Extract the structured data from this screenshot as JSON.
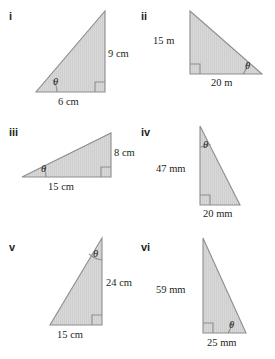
{
  "page": {
    "background": "#ffffff",
    "ink": "#231f20",
    "fill": "#d4d4d4",
    "stroke": "#8e8e8e",
    "title": ""
  },
  "figures": [
    {
      "numeral": "i",
      "theta": "θ",
      "labels": [
        "9 cm",
        "6 cm"
      ],
      "right_angle_corner": "bottom-right",
      "theta_corner": "bottom-left",
      "vertical_label": "9 cm",
      "base_label": "6 cm",
      "unit": "cm",
      "vertical_value": 9,
      "base_value": 6
    },
    {
      "numeral": "ii",
      "theta": "θ",
      "labels": [
        "15 m",
        "20 m"
      ],
      "right_angle_corner": "bottom-left",
      "theta_corner": "bottom-right",
      "vertical_label": "15 m",
      "base_label": "20 m",
      "unit": "m",
      "vertical_value": 15,
      "base_value": 20
    },
    {
      "numeral": "iii",
      "theta": "θ",
      "labels": [
        "8 cm",
        "15 cm"
      ],
      "right_angle_corner": "bottom-right",
      "theta_corner": "bottom-left",
      "vertical_label": "8 cm",
      "base_label": "15 cm",
      "unit": "cm",
      "vertical_value": 8,
      "base_value": 15
    },
    {
      "numeral": "iv",
      "theta": "θ",
      "labels": [
        "47 mm",
        "20 mm"
      ],
      "right_angle_corner": "bottom-left",
      "theta_corner": "top",
      "vertical_label": "47 mm",
      "base_label": "20 mm",
      "unit": "mm",
      "vertical_value": 47,
      "base_value": 20
    },
    {
      "numeral": "v",
      "theta": "θ",
      "labels": [
        "24 cm",
        "15 cm"
      ],
      "right_angle_corner": "bottom-right",
      "theta_corner": "top",
      "vertical_label": "24 cm",
      "base_label": "15 cm",
      "unit": "cm",
      "vertical_value": 24,
      "base_value": 15
    },
    {
      "numeral": "vi",
      "theta": "θ",
      "labels": [
        "59 mm",
        "25 mm"
      ],
      "right_angle_corner": "bottom-left",
      "theta_corner": "bottom-right",
      "vertical_label": "59 mm",
      "base_label": "25 mm",
      "unit": "mm",
      "vertical_value": 59,
      "base_value": 25
    }
  ]
}
